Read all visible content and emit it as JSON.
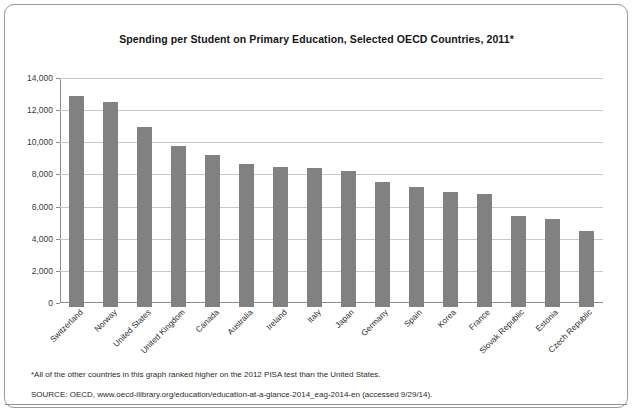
{
  "chart_data": {
    "type": "bar",
    "title": "Spending per Student on Primary Education, Selected OECD Countries, 2011*",
    "xlabel": "",
    "ylabel": "",
    "ylim": [
      0,
      14000
    ],
    "ytick_step": 2000,
    "ytick_labels": [
      "0",
      "2,000",
      "4,000",
      "6,000",
      "8,000",
      "10,000",
      "12,000",
      "14,000"
    ],
    "ytick_values": [
      0,
      2000,
      4000,
      6000,
      8000,
      10000,
      12000,
      14000
    ],
    "grid": true,
    "legend": "none",
    "bar_color": "#818181",
    "categories": [
      "Switzerland",
      "Norway",
      "United States",
      "United Kingdom",
      "Canada",
      "Australia",
      "Ireland",
      "Italy",
      "Japan",
      "Germany",
      "Spain",
      "Korea",
      "France",
      "Slovak Republic",
      "Estonia",
      "Czech Republic"
    ],
    "values": [
      12900,
      12500,
      10950,
      9800,
      9200,
      8650,
      8450,
      8400,
      8200,
      7500,
      7200,
      6900,
      6800,
      5400,
      5200,
      4450
    ]
  },
  "notes": {
    "footnote": "*All of the other countries in this graph ranked higher on the 2012 PISA test than the United States.",
    "source": "SOURCE:  OECD, www.oecd-ilibrary.org/education/education-at-a-glance-2014_eag-2014-en (accessed 9/29/14)."
  }
}
